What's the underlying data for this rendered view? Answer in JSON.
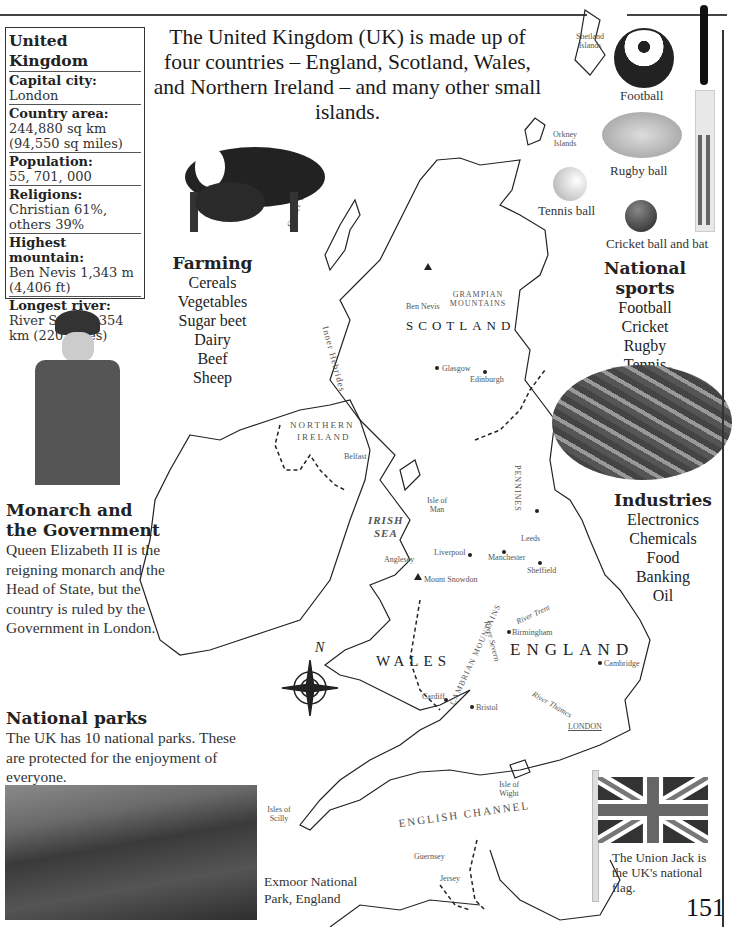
{
  "page": {
    "number": "151"
  },
  "factbox": {
    "title": "United Kingdom",
    "rows": [
      {
        "label": "Capital city",
        "value": "London"
      },
      {
        "label": "Country area",
        "value": "244,880 sq km (94,550 sq miles)"
      },
      {
        "label": "Population",
        "value": "55, 701, 000"
      },
      {
        "label": "Religions",
        "value": "Christian 61%, others 39%"
      },
      {
        "label": "Highest mountain",
        "value": "Ben Nevis 1,343 m (4,406 ft)"
      },
      {
        "label": "Longest river",
        "value": "River Severn 354 km (220 miles)"
      }
    ]
  },
  "intro": "The United Kingdom (UK) is made up of four countries – England, Scotland, Wales, and Northern Ireland – and many other small islands.",
  "farming": {
    "heading": "Farming",
    "items": [
      "Cereals",
      "Vegetables",
      "Sugar beet",
      "Dairy",
      "Beef",
      "Sheep"
    ]
  },
  "sports": {
    "captions": {
      "football": "Football",
      "rugby": "Rugby ball",
      "tennis": "Tennis ball",
      "cricket": "Cricket ball and bat"
    },
    "heading": "National sports",
    "items": [
      "Football",
      "Cricket",
      "Rugby",
      "Tennis"
    ]
  },
  "industries": {
    "heading": "Industries",
    "items": [
      "Electronics",
      "Chemicals",
      "Food",
      "Banking",
      "Oil"
    ]
  },
  "monarch": {
    "heading": "Monarch and the Government",
    "body": "Queen Elizabeth II is the reigning monarch and the Head of State, but the country is ruled by the Government in London."
  },
  "parks": {
    "heading": "National parks",
    "body": "The UK has 10 national parks. These are protected for the enjoyment of everyone.",
    "caption": "Exmoor National Park, England"
  },
  "flag": {
    "caption": "The Union Jack is the UK's national flag."
  },
  "map": {
    "regions": {
      "scotland": "SCOTLAND",
      "northern_ireland_1": "NORTHERN",
      "northern_ireland_2": "IRELAND",
      "wales": "WALES",
      "england": "ENGLAND"
    },
    "seas": {
      "irish_1": "IRISH",
      "irish_2": "SEA",
      "channel": "ENGLISH CHANNEL"
    },
    "labels": {
      "shetland": "Shetland Islands",
      "orkney": "Orkney Islands",
      "outer_hebrides": "Outer Hebrides",
      "inner_hebrides": "Inner Hebrides",
      "ben_nevis": "Ben Nevis",
      "grampian": "GRAMPIAN MOUNTAINS",
      "glasgow": "Glasgow",
      "edinburgh": "Edinburgh",
      "belfast": "Belfast",
      "isle_of_man": "Isle of Man",
      "pennines": "PENNINES",
      "leeds": "Leeds",
      "manchester": "Manchester",
      "sheffield": "Sheffield",
      "liverpool": "Liverpool",
      "anglesey": "Anglesey",
      "snowdon": "Mount Snowdon",
      "river_trent": "River Trent",
      "cambrian": "CAMBRIAN MOUNTAINS",
      "river_severn": "River Severn",
      "birmingham": "Birmingham",
      "cambridge": "Cambridge",
      "cardiff": "Cardiff",
      "bristol": "Bristol",
      "river_thames": "River Thames",
      "london": "LONDON",
      "isle_of_wight": "Isle of Wight",
      "scilly": "Isles of Scilly",
      "guernsey": "Guernsey",
      "jersey": "Jersey",
      "north": "N"
    }
  }
}
